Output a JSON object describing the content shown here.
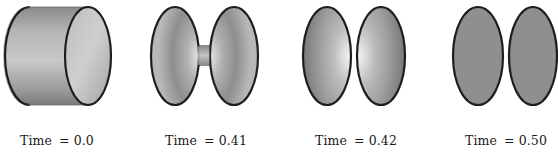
{
  "figure": {
    "panels": [
      {
        "id": "t0",
        "label_prefix": "Time",
        "label_eq": "= 0.0",
        "time": 0.0,
        "shape": "cylinder"
      },
      {
        "id": "t041",
        "label_prefix": "Time",
        "label_eq": "= 0.41",
        "time": 0.41,
        "shape": "necked-bridge"
      },
      {
        "id": "t042",
        "label_prefix": "Time",
        "label_eq": "= 0.42",
        "time": 0.42,
        "shape": "two-cones-pinched"
      },
      {
        "id": "t050",
        "label_prefix": "Time",
        "label_eq": "= 0.50",
        "time": 0.5,
        "shape": "two-flat-discs"
      }
    ]
  },
  "colors": {
    "outline": "#1e1e1e",
    "fill_light": "#d6d6d6",
    "fill_mid": "#a8a8a8",
    "fill_dark": "#6f6f6f",
    "flat_disc": "#8f8f8f"
  }
}
